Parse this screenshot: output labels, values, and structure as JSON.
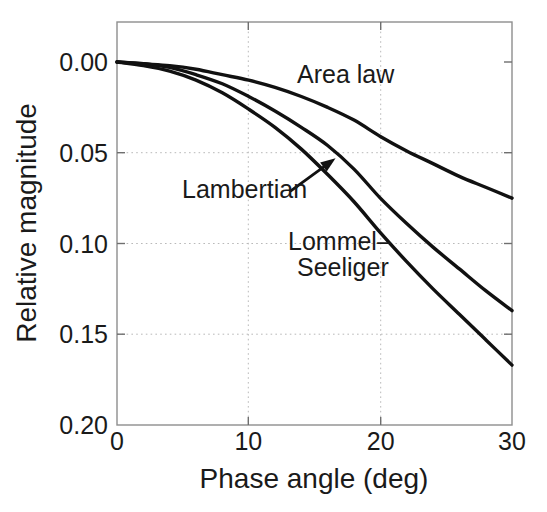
{
  "chart_data": {
    "type": "line",
    "title": "",
    "subtitle": "",
    "xlabel": "Phase angle (deg)",
    "ylabel": "Relative magnitude",
    "xlim": [
      0,
      30
    ],
    "ylim": [
      0,
      0.2
    ],
    "y_axis_inverted": true,
    "grid": true,
    "legend_position": "inline-annotations",
    "xticks": [
      0,
      10,
      20,
      30
    ],
    "xticklabels": [
      "0",
      "10",
      "20",
      "30"
    ],
    "yticks": [
      0.0,
      0.05,
      0.1,
      0.15,
      0.2
    ],
    "yticklabels": [
      "0.00",
      "0.05",
      "0.10",
      "0.15",
      "0.20"
    ],
    "x": [
      0,
      2,
      4,
      6,
      8,
      10,
      12,
      14,
      16,
      18,
      20,
      22,
      24,
      26,
      28,
      30
    ],
    "series": [
      {
        "name": "Area law",
        "values": [
          0.0,
          0.001,
          0.002,
          0.004,
          0.007,
          0.01,
          0.014,
          0.019,
          0.025,
          0.032,
          0.041,
          0.049,
          0.056,
          0.063,
          0.069,
          0.075
        ]
      },
      {
        "name": "Lambertian",
        "values": [
          0.0,
          0.001,
          0.003,
          0.007,
          0.012,
          0.019,
          0.027,
          0.036,
          0.046,
          0.059,
          0.075,
          0.089,
          0.102,
          0.114,
          0.126,
          0.137
        ]
      },
      {
        "name": "Lommel-Seeliger",
        "values": [
          0.0,
          0.002,
          0.005,
          0.01,
          0.017,
          0.026,
          0.036,
          0.048,
          0.062,
          0.077,
          0.094,
          0.11,
          0.125,
          0.139,
          0.153,
          0.167
        ]
      }
    ],
    "annotations": [
      {
        "text": "Area law",
        "x": 13.7,
        "y": 0.013,
        "role": "curve-label"
      },
      {
        "text": "Lambertian",
        "x": 5.2,
        "y": 0.072,
        "role": "curve-label-with-arrow"
      },
      {
        "text": "Lommel–",
        "x": 13.0,
        "y": 0.103,
        "role": "curve-label"
      },
      {
        "text": "Seeliger",
        "x": 13.6,
        "y": 0.116,
        "role": "curve-label"
      }
    ],
    "arrow": {
      "from_x": 13.2,
      "from_y": 0.071,
      "to_x": 16.6,
      "to_y": 0.053,
      "role": "lambertian-pointer"
    },
    "colors": {
      "curve": "#111111",
      "axis": "#8e8e8e",
      "grid": "#b9b9b9",
      "text": "#1a1a1a",
      "background": "#ffffff"
    }
  },
  "ticks": {
    "x": [
      "0",
      "10",
      "20",
      "30"
    ],
    "y": [
      "0.00",
      "0.05",
      "0.10",
      "0.15",
      "0.20"
    ]
  },
  "axes": {
    "x_title": "Phase angle (deg)",
    "y_title": "Relative magnitude"
  },
  "labels": {
    "area_law": "Area law",
    "lambertian": "Lambertian",
    "lommel": "Lommel–",
    "seeliger": "Seeliger"
  }
}
